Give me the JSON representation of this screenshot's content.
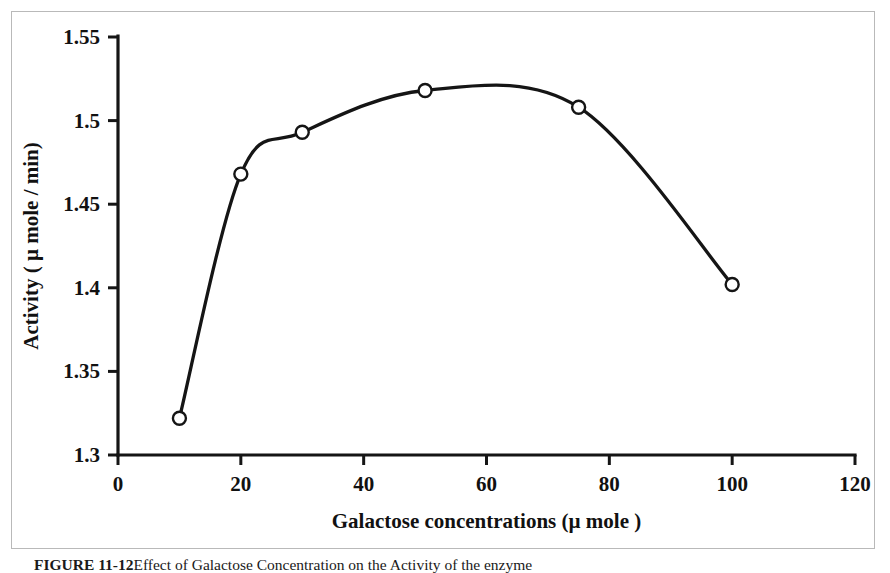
{
  "figure": {
    "caption_label": "FIGURE 11-12",
    "caption_text": "Effect of Galactose Concentration on the Activity of the enzyme",
    "frame_color": "#b9b9b9",
    "ink_color": "#151515",
    "background_color": "#ffffff"
  },
  "chart_data": {
    "type": "line",
    "title": "",
    "subtitle": "",
    "xlabel": "Galactose concentrations (µ mole )",
    "ylabel": "Activity ( µ mole / min)",
    "xlim": [
      0,
      120
    ],
    "ylim": [
      1.3,
      1.55
    ],
    "xticks": [
      0,
      20,
      40,
      60,
      80,
      100,
      120
    ],
    "yticks": [
      1.3,
      1.35,
      1.4,
      1.45,
      1.5,
      1.55
    ],
    "xtick_labels": [
      "0",
      "20",
      "40",
      "60",
      "80",
      "100",
      "120"
    ],
    "ytick_labels": [
      "1.3",
      "1.35",
      "1.4",
      "1.45",
      "1.5",
      "1.55"
    ],
    "grid": false,
    "legend": false,
    "legend_position": "none",
    "marker": "open-circle",
    "smoothing": "spline",
    "x": [
      10,
      20,
      30,
      50,
      75,
      100
    ],
    "values": [
      1.322,
      1.468,
      1.493,
      1.518,
      1.508,
      1.402
    ],
    "series": [
      {
        "name": "Activity",
        "x": [
          10,
          20,
          30,
          50,
          75,
          100
        ],
        "values": [
          1.322,
          1.468,
          1.493,
          1.518,
          1.508,
          1.402
        ]
      }
    ],
    "annotations": []
  }
}
